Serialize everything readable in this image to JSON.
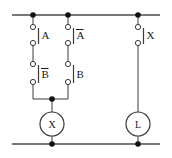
{
  "diagram": {
    "type": "ladder-circuit",
    "stroke_color": "#3a3a3a",
    "rail_color": "#4a4a4a",
    "node_color": "#111111",
    "text_color": "#1a1a1a",
    "background": "#ffffff"
  },
  "rails": {
    "top": {
      "name": "top-power-rail",
      "y": 15,
      "x1": 12,
      "x2": 160
    },
    "bottom": {
      "name": "bottom-power-rail",
      "y": 144,
      "x1": 12,
      "x2": 160
    }
  },
  "nodes": [
    {
      "name": "top-node-branch-1",
      "x": 33,
      "y": 15
    },
    {
      "name": "top-node-branch-2",
      "x": 68,
      "y": 15
    },
    {
      "name": "top-node-branch-3",
      "x": 138,
      "y": 15
    },
    {
      "name": "merge-node-coil-x",
      "x": 52,
      "y": 99
    },
    {
      "name": "bottom-node-coil-x",
      "x": 52,
      "y": 144
    },
    {
      "name": "bottom-node-lamp-l",
      "x": 138,
      "y": 144
    }
  ],
  "contacts": [
    {
      "id": "contact-a",
      "label": "A",
      "overbar": false,
      "type": "normally-open",
      "branch": "left",
      "x": 33,
      "y_top": 25,
      "y_bottom": 45,
      "bar_x": 38,
      "label_x": 42,
      "label_y": 39
    },
    {
      "id": "contact-a-not",
      "label": "A",
      "overbar": true,
      "type": "normally-closed",
      "branch": "middle",
      "x": 68,
      "y_top": 25,
      "y_bottom": 45,
      "bar_x": 73,
      "label_x": 77,
      "label_y": 39
    },
    {
      "id": "contact-b-not",
      "label": "B",
      "overbar": true,
      "type": "normally-closed",
      "branch": "left",
      "x": 33,
      "y_top": 62,
      "y_bottom": 84,
      "bar_x": 38,
      "label_x": 42,
      "label_y": 78
    },
    {
      "id": "contact-b",
      "label": "B",
      "overbar": false,
      "type": "normally-open",
      "branch": "middle",
      "x": 68,
      "y_top": 62,
      "y_bottom": 84,
      "bar_x": 73,
      "label_x": 77,
      "label_y": 78
    },
    {
      "id": "contact-x",
      "label": "X",
      "overbar": false,
      "type": "normally-open",
      "branch": "right",
      "x": 138,
      "y_top": 25,
      "y_bottom": 45,
      "bar_x": 143,
      "label_x": 147,
      "label_y": 39
    }
  ],
  "devices": [
    {
      "id": "coil-x",
      "label": "X",
      "kind": "relay-coil",
      "cx": 52,
      "cy": 124,
      "r": 12
    },
    {
      "id": "lamp-l",
      "label": "L",
      "kind": "lamp",
      "cx": 138,
      "cy": 124,
      "r": 12
    }
  ],
  "wires": {
    "left_branch_down": {
      "x": 33,
      "y1": 15,
      "y2": 99
    },
    "middle_branch_down": {
      "x": 68,
      "y1": 15,
      "y2": 99
    },
    "merge_horizontal": {
      "y": 99,
      "x1": 33,
      "x2": 68
    },
    "coil_x_lead_top": {
      "x": 52,
      "y1": 99,
      "y2": 112
    },
    "coil_x_lead_bottom": {
      "x": 52,
      "y1": 136,
      "y2": 144
    },
    "right_branch_down": {
      "x": 138,
      "y1": 15,
      "y2": 112
    },
    "lamp_l_lead_bottom": {
      "x": 138,
      "y1": 136,
      "y2": 144
    }
  },
  "legend": {
    "branch_1": "A",
    "branch_1_series": "B",
    "branch_2": "A-not",
    "branch_2_series": "B",
    "output_left": "X",
    "output_right": "L"
  }
}
